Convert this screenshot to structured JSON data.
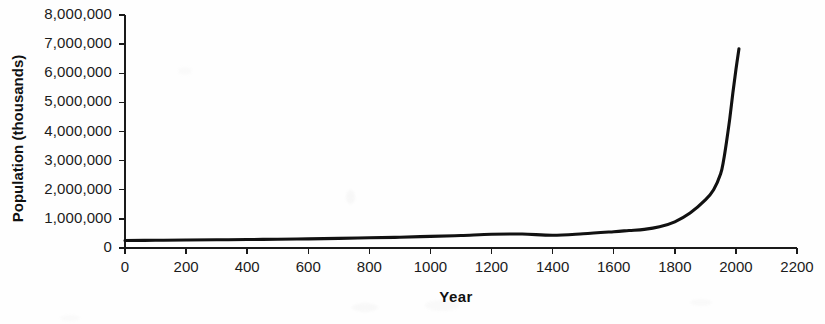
{
  "chart_data": {
    "type": "line",
    "title": "",
    "xlabel": "Year",
    "ylabel": "Population (thousands)",
    "xlim": [
      0,
      2200
    ],
    "ylim": [
      0,
      8000000
    ],
    "grid": false,
    "legend": "none",
    "x_ticks": [
      0,
      200,
      400,
      600,
      800,
      1000,
      1200,
      1400,
      1600,
      1800,
      2000,
      2200
    ],
    "x_tick_labels": [
      "0",
      "200",
      "400",
      "600",
      "800",
      "1000",
      "1200",
      "1400",
      "1600",
      "1800",
      "2000",
      "2200"
    ],
    "y_ticks": [
      0,
      1000000,
      2000000,
      3000000,
      4000000,
      5000000,
      6000000,
      7000000,
      8000000
    ],
    "y_tick_labels": [
      "0",
      "1,000,000",
      "2,000,000",
      "3,000,000",
      "4,000,000",
      "5,000,000",
      "6,000,000",
      "7,000,000",
      "8,000,000"
    ],
    "series": [
      {
        "name": "World population",
        "color": "#111111",
        "x": [
          0,
          100,
          200,
          300,
          400,
          500,
          600,
          700,
          800,
          900,
          1000,
          1100,
          1200,
          1300,
          1400,
          1500,
          1600,
          1650,
          1700,
          1750,
          1800,
          1850,
          1900,
          1927,
          1950,
          1960,
          1970,
          1980,
          1990,
          2000,
          2010
        ],
        "y": [
          255000,
          265000,
          275000,
          282000,
          290000,
          300000,
          315000,
          330000,
          350000,
          370000,
          400000,
          430000,
          470000,
          480000,
          440000,
          490000,
          560000,
          600000,
          640000,
          730000,
          900000,
          1200000,
          1650000,
          2000000,
          2550000,
          3030000,
          3700000,
          4450000,
          5320000,
          6120000,
          6840000
        ]
      }
    ]
  },
  "axis_labels": {
    "x_title": "Year",
    "y_title": "Population (thousands)"
  }
}
